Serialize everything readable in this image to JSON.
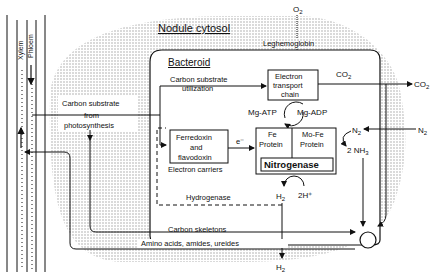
{
  "diagram": {
    "regions": {
      "nodule_cytosol": "Nodule cytosol",
      "bacteroid": "Bacteroid",
      "xylem": "Xylem",
      "phloem": "Phloem"
    },
    "labels": {
      "o2_top": "O",
      "o2_sub": "2",
      "leghemoglobin": "Leghemoglobin",
      "carbon_substrate_util_1": "Carbon substrate",
      "carbon_substrate_util_2": "utilization",
      "electron_transport_1": "Electron",
      "electron_transport_2": "transport",
      "electron_transport_3": "chain",
      "co2_inner": "CO",
      "co2_inner_sub": "2",
      "co2_outer": "CO",
      "co2_outer_sub": "2",
      "mg_atp": "Mg-ATP",
      "mg_adp": "Mg-ADP",
      "carbon_from_1": "Carbon substrate",
      "carbon_from_2": "from",
      "carbon_from_3": "photosynthesis",
      "ferredoxin_1": "Ferredoxin",
      "ferredoxin_2": "and",
      "ferredoxin_3": "flavodoxin",
      "electron_carriers": "Electron carriers",
      "e_minus": "e⁻",
      "fe_protein_1": "Fe",
      "fe_protein_2": "Protein",
      "mofe_protein_1": "Mo-Fe",
      "mofe_protein_2": "Protein",
      "nitrogenase": "Nitrogenase",
      "n2_inner": "N",
      "n2_inner_sub": "2",
      "n2_outer": "N",
      "n2_outer_sub": "2",
      "nh3": "2 NH",
      "nh3_sub": "3",
      "hydrogenase": "Hydrogenase",
      "h2_inner": "H",
      "h2_inner_sub": "2",
      "two_h_plus": "2H⁺",
      "carbon_skeletons": "Carbon skeletons",
      "amino_acids": "Amino acids, amides, ureides",
      "h2_bottom": "H",
      "h2_bottom_sub": "2"
    }
  }
}
